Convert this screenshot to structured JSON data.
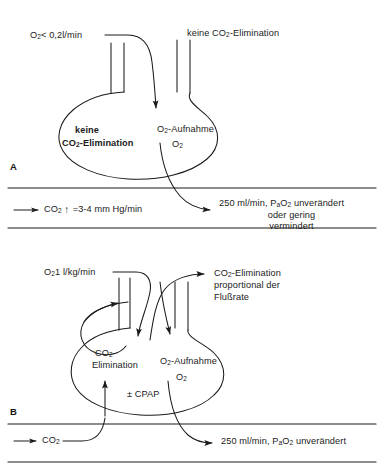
{
  "figure": {
    "title": "",
    "background_color": "#ffffff",
    "stroke_color": "#1a1a1a"
  },
  "panel_a": {
    "letter": "A",
    "inflow_left_label": "O2< 0,2l/min",
    "inflow_right_label": "keine CO2-Elimination",
    "lung_left_label_line1": "keine",
    "lung_left_label_line2": "CO2-Elimination",
    "lung_right_label_line1": "O2-Aufnahme",
    "lung_right_label_line2": "O2",
    "outflow_co2_label": "CO2",
    "outflow_co2_rate": "=3-4 mm Hg/min",
    "outflow_o2_line1": "250 ml/min, PaO2 unverändert",
    "outflow_o2_line2": "oder gering",
    "outflow_o2_line3": "vermindert"
  },
  "panel_b": {
    "letter": "B",
    "inflow_left_label": "O2 1 l/kg/min",
    "outflow_top_line1": "CO2-Elimination",
    "outflow_top_line2": "proportional der",
    "outflow_top_line3": "Flußrate",
    "lung_left_label_line1": "CO2-",
    "lung_left_label_line2": "Elimination",
    "lung_right_label_line1": "O2-Aufnahme",
    "lung_right_label_line2": "O2",
    "cpap_label": "± CPAP",
    "inflow_co2_label": "CO2",
    "outflow_o2_label": "250 ml/min, PaO2 unverändert"
  }
}
